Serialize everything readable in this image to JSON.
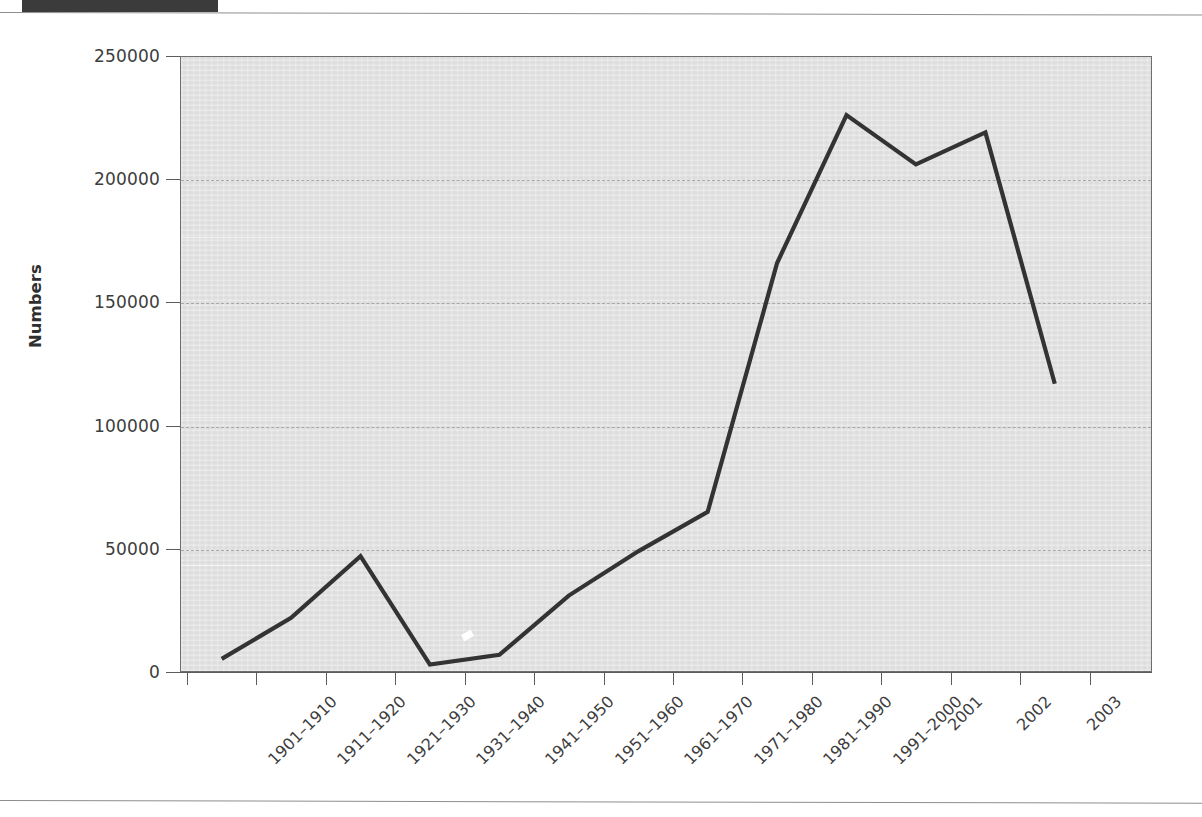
{
  "page": {
    "header_block_label": "",
    "rules": [
      "top-rule",
      "bottom-rule"
    ]
  },
  "chart_data": {
    "type": "line",
    "title": "",
    "xlabel": "",
    "ylabel": "Numbers",
    "ylim": [
      0,
      250000
    ],
    "ytick_labels": [
      "0",
      "50000",
      "100000",
      "150000",
      "200000",
      "250000"
    ],
    "ytick_values": [
      0,
      50000,
      100000,
      150000,
      200000,
      250000
    ],
    "grid": "horizontal-dashed",
    "legend": "none",
    "categories": [
      "1901–1910",
      "1911–1920",
      "1921–1930",
      "1931–1940",
      "1941–1950",
      "1951–1960",
      "1961–1970",
      "1971–1980",
      "1981–1990",
      "1991–2000",
      "2001",
      "2002",
      "2003"
    ],
    "values": [
      5300,
      22000,
      47000,
      3000,
      7000,
      31000,
      49000,
      65000,
      166000,
      226000,
      206000,
      219000,
      117000
    ],
    "series": [
      {
        "name": "Numbers",
        "color": "#333333",
        "values": [
          5300,
          22000,
          47000,
          3000,
          7000,
          31000,
          49000,
          65000,
          166000,
          226000,
          206000,
          219000,
          117000
        ]
      }
    ],
    "colors": {
      "line": "#333333",
      "plot_background": "#e2e2e2",
      "gridline": "#a8a8a8",
      "axis": "#5c5c5c",
      "text": "#3d3d3d"
    }
  }
}
